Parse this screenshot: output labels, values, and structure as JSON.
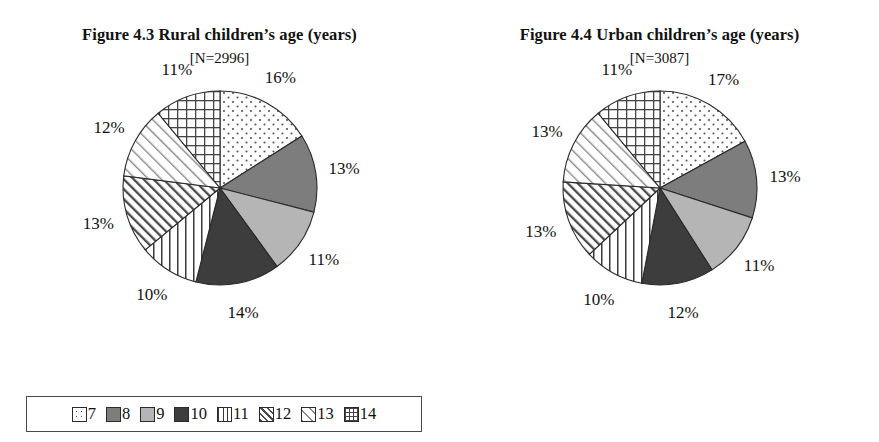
{
  "figures": [
    {
      "title": "Figure 4.3  Rural children’s age (years)",
      "subtitle": "[N=2996]",
      "labels": [
        "16%",
        "13%",
        "11%",
        "14%",
        "10%",
        "13%",
        "12%",
        "11%"
      ]
    },
    {
      "title": "Figure 4.4  Urban children’s age (years)",
      "subtitle": "[N=3087]",
      "labels": [
        "17%",
        "13%",
        "11%",
        "12%",
        "10%",
        "13%",
        "13%",
        "11%"
      ]
    }
  ],
  "legend": {
    "items": [
      {
        "label": "7",
        "pattern": "dots"
      },
      {
        "label": "8",
        "pattern": "dark-gray"
      },
      {
        "label": "9",
        "pattern": "light-gray"
      },
      {
        "label": "10",
        "pattern": "near-black"
      },
      {
        "label": "11",
        "pattern": "vertical-lines"
      },
      {
        "label": "12",
        "pattern": "diagonal-dense"
      },
      {
        "label": "13",
        "pattern": "diagonal-sparse"
      },
      {
        "label": "14",
        "pattern": "grid"
      }
    ]
  },
  "colors": {
    "dark_gray": "#7d7d7d",
    "light_gray": "#b5b5b5",
    "near_black": "#3d3d3d",
    "outline": "#2a2a2a",
    "background": "#ffffff"
  },
  "chart_data": [
    {
      "type": "pie",
      "title": "Figure 4.3  Rural children’s age (years)",
      "subtitle": "[N=2996]",
      "n": 2996,
      "xlabel": "",
      "ylabel": "",
      "legend_position": "bottom",
      "grid": false,
      "categories": [
        "7",
        "8",
        "9",
        "10",
        "11",
        "12",
        "13",
        "14"
      ],
      "values": [
        16,
        13,
        11,
        14,
        10,
        13,
        12,
        11
      ],
      "value_labels": [
        "16%",
        "13%",
        "11%",
        "14%",
        "10%",
        "13%",
        "12%",
        "11%"
      ],
      "units": "percent",
      "start_angle_deg": 0,
      "direction": "clockwise"
    },
    {
      "type": "pie",
      "title": "Figure 4.4  Urban children’s age (years)",
      "subtitle": "[N=3087]",
      "n": 3087,
      "xlabel": "",
      "ylabel": "",
      "legend_position": "bottom",
      "grid": false,
      "categories": [
        "7",
        "8",
        "9",
        "10",
        "11",
        "12",
        "13",
        "14"
      ],
      "values": [
        17,
        13,
        11,
        12,
        10,
        13,
        13,
        11
      ],
      "value_labels": [
        "17%",
        "13%",
        "11%",
        "12%",
        "10%",
        "13%",
        "13%",
        "11%"
      ],
      "units": "percent",
      "start_angle_deg": 0,
      "direction": "clockwise"
    }
  ]
}
